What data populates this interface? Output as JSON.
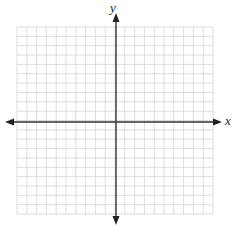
{
  "chart_data": {
    "type": "blank-coordinate-plane",
    "title": "",
    "xlabel": "x",
    "ylabel": "y",
    "grid": true,
    "grid_cells_x": 20,
    "grid_cells_y": 20,
    "xlim": [
      -10,
      10
    ],
    "ylim": [
      -10,
      10
    ],
    "tick_labels": [],
    "series": [],
    "axes_arrows": true
  },
  "colors": {
    "grid": "#d4d4d4",
    "axis": "#333333",
    "background": "#ffffff"
  },
  "labels": {
    "x_axis": "x",
    "y_axis": "y"
  }
}
